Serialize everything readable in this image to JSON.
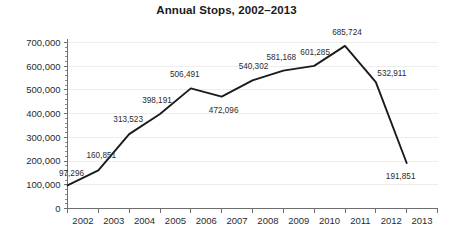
{
  "chart_data": {
    "type": "line",
    "title": "Annual Stops, 2002–2013",
    "xlabel": "",
    "ylabel": "",
    "categories": [
      "2002",
      "2003",
      "2004",
      "2005",
      "2006",
      "2007",
      "2008",
      "2009",
      "2010",
      "2011",
      "2012",
      "2013"
    ],
    "values": [
      97296,
      160851,
      313523,
      398191,
      506491,
      472096,
      540302,
      581168,
      601285,
      685724,
      532911,
      191851
    ],
    "point_labels": [
      "97,296",
      "160,851",
      "313,523",
      "398,191",
      "506,491",
      "472,096",
      "540,302",
      "581,168",
      "601,285",
      "685,724",
      "532,911",
      "191,851"
    ],
    "ylim": [
      0,
      700000
    ],
    "ytick_values": [
      0,
      100000,
      200000,
      300000,
      400000,
      500000,
      600000,
      700000
    ],
    "ytick_labels": [
      "0",
      "100,000",
      "200,000",
      "300,000",
      "400,000",
      "500,000",
      "600,000",
      "700,000"
    ],
    "y_minor_ticks_per_interval": 4,
    "grid": true,
    "grid_axis": "y",
    "legend": false,
    "legend_position": "none",
    "series": [
      {
        "name": "Annual Stops",
        "color": "#1b1b1b",
        "values": [
          97296,
          160851,
          313523,
          398191,
          506491,
          472096,
          540302,
          581168,
          601285,
          685724,
          532911,
          191851
        ]
      }
    ],
    "colors": {
      "line": "#1b1b1b",
      "grid": "#ededed",
      "axis": "#6f6f6f",
      "text": "#2b2b2b",
      "title": "#1a1a1a",
      "background": "#ffffff"
    }
  }
}
